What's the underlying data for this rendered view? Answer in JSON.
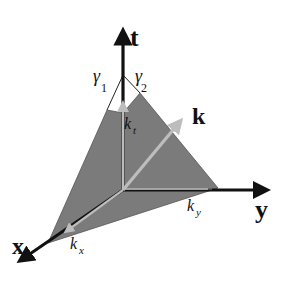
{
  "diagram": {
    "axes": {
      "t": "t",
      "y": "y",
      "x": "x"
    },
    "vector": "k",
    "components": {
      "kt": {
        "base": "k",
        "sub": "t"
      },
      "ky": {
        "base": "k",
        "sub": "y"
      },
      "kx": {
        "base": "k",
        "sub": "x"
      }
    },
    "angles": {
      "gamma1": {
        "base": "γ",
        "sub": "1"
      },
      "gamma2": {
        "base": "γ",
        "sub": "2"
      }
    },
    "colors": {
      "cone_fill": "#7a7a7a",
      "axis": "#111111",
      "vector": "#b8b8b8",
      "background": "#ffffff"
    }
  }
}
